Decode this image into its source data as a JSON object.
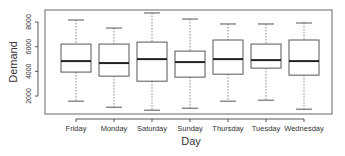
{
  "chart_data": {
    "type": "boxplot",
    "title": "",
    "xlabel": "Day",
    "ylabel": "Demand",
    "ylim": [
      0,
      9000
    ],
    "yticks": [
      2000,
      4000,
      6000,
      8000
    ],
    "ytick_labels": [
      "2000",
      "4000",
      "6000",
      "8000"
    ],
    "grid": false,
    "legend": null,
    "categories": [
      "Friday",
      "Monday",
      "Saturday",
      "Sunday",
      "Thursday",
      "Tuesday",
      "Wednesday"
    ],
    "series": [
      {
        "name": "Friday",
        "whisker_low": 1580,
        "q1": 3940,
        "median": 4830,
        "q3": 6210,
        "whisker_high": 8160
      },
      {
        "name": "Monday",
        "whisker_low": 1090,
        "q1": 3610,
        "median": 4670,
        "q3": 6210,
        "whisker_high": 7510
      },
      {
        "name": "Saturday",
        "whisker_low": 850,
        "q1": 3200,
        "median": 4990,
        "q3": 6370,
        "whisker_high": 8730
      },
      {
        "name": "Sunday",
        "whisker_low": 1010,
        "q1": 3530,
        "median": 4750,
        "q3": 5640,
        "whisker_high": 8240
      },
      {
        "name": "Thursday",
        "whisker_low": 1580,
        "q1": 3770,
        "median": 4990,
        "q3": 6540,
        "whisker_high": 7840
      },
      {
        "name": "Tuesday",
        "whisker_low": 1660,
        "q1": 4260,
        "median": 4910,
        "q3": 6210,
        "whisker_high": 7840
      },
      {
        "name": "Wednesday",
        "whisker_low": 930,
        "q1": 3690,
        "median": 4830,
        "q3": 6540,
        "whisker_high": 7920
      }
    ]
  },
  "colors": {
    "axis": "#555555",
    "box_stroke": "#555555",
    "median": "#222222",
    "whisker": "#888888",
    "text": "#333333"
  }
}
